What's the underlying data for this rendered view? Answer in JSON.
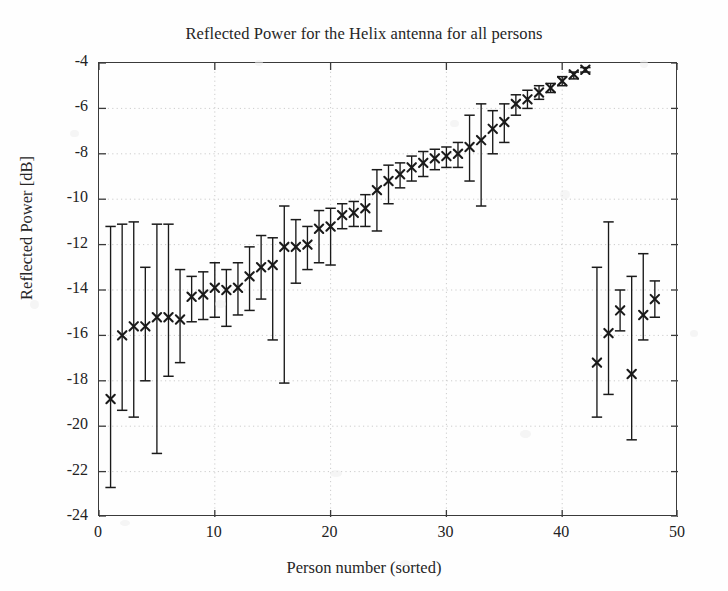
{
  "chart_data": {
    "type": "scatter",
    "title": "Reflected Power for the Helix antenna for all persons",
    "xlabel": "Person number (sorted)",
    "ylabel": "Reflected Power [dB]",
    "xlim": [
      0,
      50
    ],
    "ylim": [
      -24,
      -4
    ],
    "xticks": [
      0,
      10,
      20,
      30,
      40,
      50
    ],
    "yticks": [
      -24,
      -22,
      -20,
      -18,
      -16,
      -14,
      -12,
      -10,
      -8,
      -6,
      -4
    ],
    "grid": true,
    "grid_style": "dotted",
    "legend": null,
    "marker": "x",
    "errorbar": "vertical-with-caps",
    "series": [
      {
        "name": "Reflected Power",
        "x": [
          1,
          2,
          3,
          4,
          5,
          6,
          7,
          8,
          9,
          10,
          11,
          12,
          13,
          14,
          15,
          16,
          17,
          18,
          19,
          20,
          21,
          22,
          23,
          24,
          25,
          26,
          27,
          28,
          29,
          30,
          31,
          32,
          33,
          34,
          35,
          36,
          37,
          38,
          39,
          40,
          41,
          42,
          43,
          44,
          45,
          46,
          47,
          48
        ],
        "values": [
          -18.8,
          -16.0,
          -15.6,
          -15.6,
          -15.2,
          -15.2,
          -15.3,
          -14.3,
          -14.2,
          -13.9,
          -14.0,
          -13.9,
          -13.4,
          -13.0,
          -12.9,
          -12.1,
          -12.1,
          -12.0,
          -11.3,
          -11.2,
          -10.7,
          -10.6,
          -10.4,
          -9.6,
          -9.2,
          -8.9,
          -8.6,
          -8.4,
          -8.2,
          -8.1,
          -8.0,
          -7.7,
          -7.4,
          -6.9,
          -6.6,
          -5.8,
          -5.6,
          -5.3,
          -5.1,
          -4.8,
          -4.5,
          -4.3,
          -17.2,
          -15.9,
          -14.9,
          -17.7,
          -15.1,
          -14.4
        ],
        "err_low": [
          -22.7,
          -19.3,
          -19.6,
          -18.0,
          -21.2,
          -17.8,
          -17.2,
          -15.4,
          -15.3,
          -15.2,
          -15.6,
          -15.1,
          -14.9,
          -14.4,
          -16.2,
          -18.1,
          -13.7,
          -13.1,
          -12.8,
          -12.9,
          -11.3,
          -11.2,
          -11.2,
          -11.4,
          -10.2,
          -9.5,
          -9.2,
          -9.0,
          -8.7,
          -8.6,
          -8.6,
          -9.2,
          -10.3,
          -8.0,
          -7.5,
          -6.3,
          -6.0,
          -5.6,
          -5.3,
          -5.0,
          -4.7,
          -4.4,
          -19.6,
          -18.6,
          -15.8,
          -20.6,
          -16.2,
          -15.2
        ],
        "err_high": [
          -11.2,
          -11.1,
          -11.0,
          -13.0,
          -11.1,
          -11.1,
          -13.1,
          -13.4,
          -13.2,
          -12.8,
          -13.1,
          -12.8,
          -12.1,
          -11.6,
          -11.7,
          -10.3,
          -10.9,
          -11.2,
          -10.5,
          -10.4,
          -10.2,
          -10.1,
          -9.8,
          -8.7,
          -8.5,
          -8.4,
          -8.1,
          -7.9,
          -7.8,
          -7.7,
          -7.5,
          -6.3,
          -5.8,
          -6.1,
          -5.8,
          -5.4,
          -5.2,
          -5.0,
          -4.9,
          -4.6,
          -4.4,
          -4.2,
          -13.0,
          -11.0,
          -14.0,
          -13.4,
          -12.4,
          -13.6
        ]
      }
    ]
  },
  "figure": {
    "background_color": "#fefefe",
    "axis_color": "#3a3a3a",
    "marker_color": "#1a1a1a",
    "grid_color": "#cccccc"
  }
}
